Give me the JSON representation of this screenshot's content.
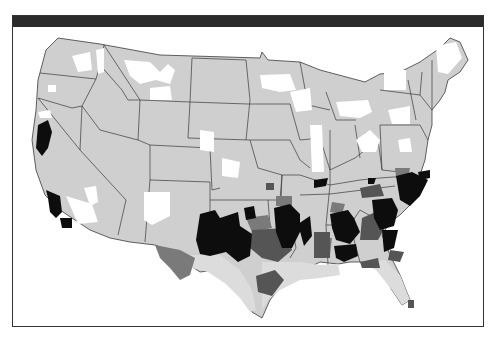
{
  "figure": {
    "type": "choropleth map",
    "region": "Contiguous United States",
    "header_bar": "",
    "colors": {
      "background": "#ffffff",
      "frame": "#333333",
      "header_bar": "#2b2b2b",
      "state_border": "#3a3a3a",
      "category_none": "#ffffff",
      "category_light": "#cfcfcf",
      "category_light_south": "#dcdcdc",
      "category_medium": "#7a7a7a",
      "category_dark": "#555555",
      "category_black": "#0d0d0d"
    },
    "legend": []
  }
}
